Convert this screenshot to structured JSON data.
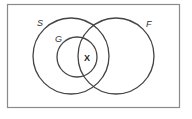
{
  "diagram": {
    "type": "venn",
    "frame": {
      "x": 7,
      "y": 4,
      "width": 173,
      "height": 104,
      "stroke": "#8a8a8a"
    },
    "sets": [
      {
        "name": "S",
        "cx": 71,
        "cy": 56,
        "r": 38,
        "label_x": 37,
        "label_y": 26
      },
      {
        "name": "G",
        "cx": 77,
        "cy": 57,
        "r": 20,
        "label_x": 55,
        "label_y": 42
      },
      {
        "name": "F",
        "cx": 116,
        "cy": 56,
        "r": 38,
        "label_x": 146,
        "label_y": 27
      }
    ],
    "marker": {
      "text": "X",
      "x": 87,
      "y": 61,
      "region": "G ∩ F"
    },
    "stroke_color": "#444444"
  }
}
